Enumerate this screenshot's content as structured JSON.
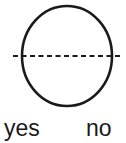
{
  "figure": {
    "background_color": "#ffffff",
    "stroke_color": "#1a1a1a",
    "shape": {
      "name": "circle",
      "center_x": 67,
      "center_y": 56,
      "radius_x": 45,
      "radius_y": 50,
      "stroke_width": 2.6,
      "fill": "none"
    },
    "axis_line": {
      "name": "horizontal-dashed-line",
      "x_start": 13,
      "x_end": 122,
      "y": 56,
      "stroke_width": 2,
      "dash": "5,3.5"
    }
  },
  "labels": {
    "yes": "yes",
    "no": "no"
  }
}
